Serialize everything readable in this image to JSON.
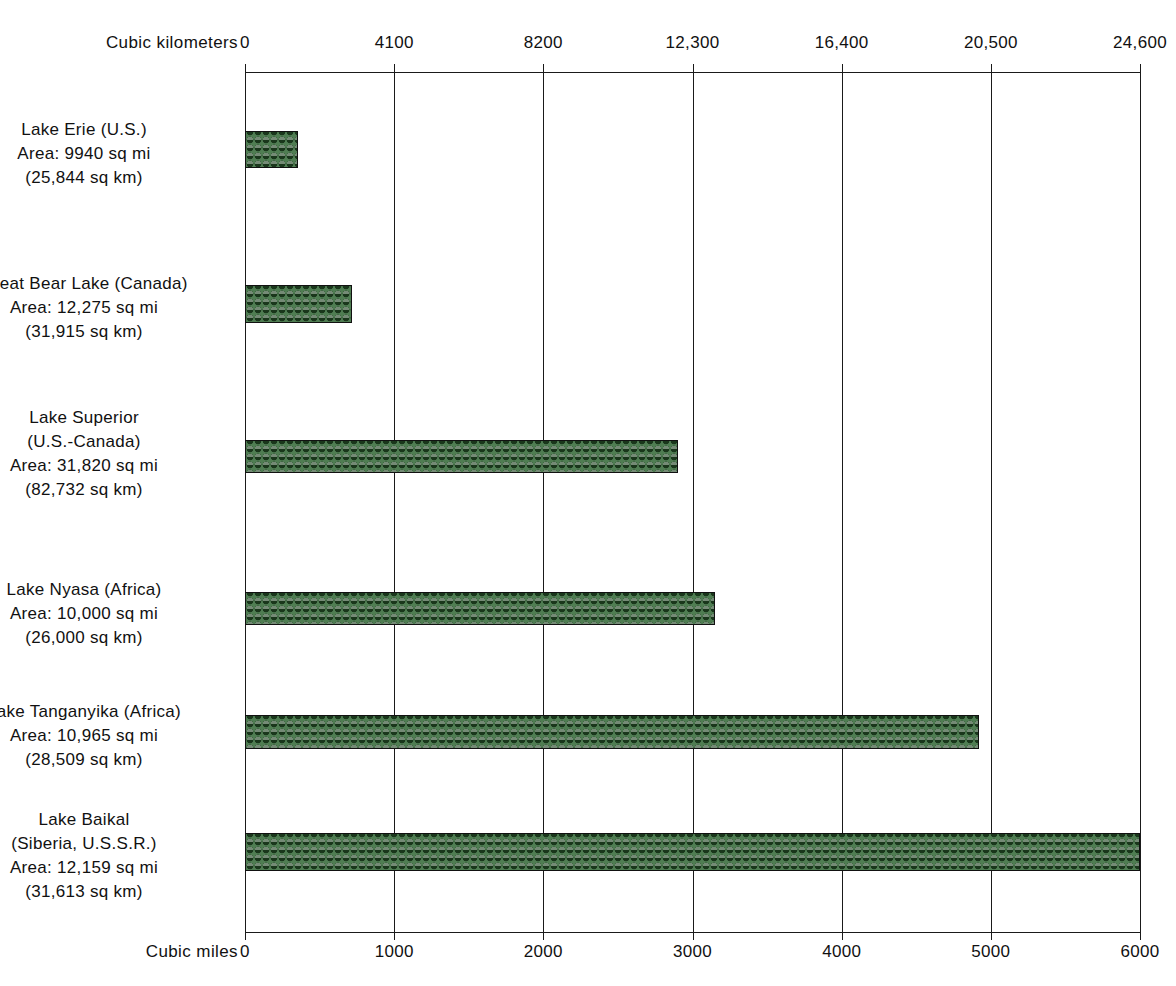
{
  "chart_data": {
    "type": "bar",
    "orientation": "horizontal",
    "title": "",
    "categories": [
      "Lake Erie (U.S.)",
      "Great Bear Lake (Canada)",
      "Lake Superior (U.S.-Canada)",
      "Lake Nyasa (Africa)",
      "Lake Tanganyika (Africa)",
      "Lake Baikal (Siberia, U.S.S.R.)"
    ],
    "series": [
      {
        "name": "Volume (cubic kilometers)",
        "values": [
          1460,
          2950,
          11900,
          12900,
          20200,
          24600
        ]
      },
      {
        "name": "Volume (cubic miles)",
        "values": [
          356,
          720,
          2900,
          3150,
          4920,
          6000
        ]
      }
    ],
    "top_axis": {
      "label": "Cubic kilometers",
      "ticks": [
        "0",
        "4100",
        "8200",
        "12,300",
        "16,400",
        "20,500",
        "24,600"
      ],
      "tick_values": [
        0,
        4100,
        8200,
        12300,
        16400,
        20500,
        24600
      ],
      "range": [
        0,
        24600
      ]
    },
    "bottom_axis": {
      "label": "Cubic miles",
      "ticks": [
        "0",
        "1000",
        "2000",
        "3000",
        "4000",
        "5000",
        "6000"
      ],
      "tick_values": [
        0,
        1000,
        2000,
        3000,
        4000,
        5000,
        6000
      ],
      "range": [
        0,
        6000
      ]
    },
    "grid": true,
    "legend": "none",
    "bar_color": "#4f7d52",
    "bar_outline_color": "#111111"
  },
  "rows": [
    {
      "id": "lake-erie",
      "lines": [
        "Lake Erie (U.S.)",
        "Area:  9940 sq mi",
        "(25,844 sq km)"
      ],
      "cubic_miles": 356,
      "cubic_km": 1460
    },
    {
      "id": "great-bear-lake",
      "lines": [
        "Great Bear Lake (Canada)",
        "Area: 12,275 sq mi",
        "(31,915 sq km)"
      ],
      "cubic_miles": 720,
      "cubic_km": 2950
    },
    {
      "id": "lake-superior",
      "lines": [
        "Lake Superior",
        "(U.S.-Canada)",
        "Area: 31,820 sq mi",
        "(82,732 sq km)"
      ],
      "cubic_miles": 2900,
      "cubic_km": 11900
    },
    {
      "id": "lake-nyasa",
      "lines": [
        "Lake Nyasa (Africa)",
        "Area: 10,000 sq mi",
        "(26,000 sq km)"
      ],
      "cubic_miles": 3150,
      "cubic_km": 12900
    },
    {
      "id": "lake-tanganyika",
      "lines": [
        "Lake Tanganyika (Africa)",
        "Area: 10,965 sq mi",
        "(28,509 sq km)"
      ],
      "cubic_miles": 4920,
      "cubic_km": 20200
    },
    {
      "id": "lake-baikal",
      "lines": [
        "Lake Baikal",
        "(Siberia, U.S.S.R.)",
        "Area: 12,159 sq mi",
        "(31,613 sq km)"
      ],
      "cubic_miles": 6000,
      "cubic_km": 24600
    }
  ],
  "layout": {
    "plot_left": 245,
    "plot_width": 895,
    "bar_tops": [
      59,
      213,
      368,
      520,
      643,
      761
    ],
    "bar_heights": [
      37,
      38,
      33,
      33,
      34,
      38
    ],
    "label_tops": [
      118,
      272,
      406,
      578,
      700,
      808
    ]
  }
}
